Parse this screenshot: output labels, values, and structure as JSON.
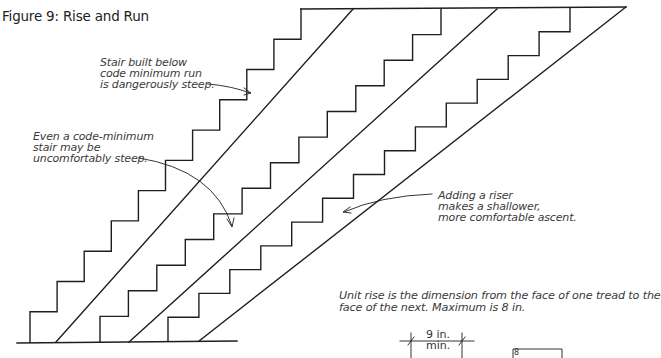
{
  "figure": {
    "title": "Figure 9: Rise and Run",
    "annotations": {
      "below_code": {
        "lines": [
          "Stair built below",
          "code minimum run",
          "is dangerously steep."
        ]
      },
      "code_minimum": {
        "lines": [
          "Even a code-minimum",
          "stair may be",
          "uncomfortably steep."
        ]
      },
      "adding_riser": {
        "lines": [
          "Adding a riser",
          "makes a shallower,",
          "more comfortable ascent."
        ]
      },
      "unit_rise": {
        "lines": [
          "Unit rise is the dimension from the face of one tread to the",
          "face of the next. Maximum is 8 in."
        ]
      }
    },
    "dimension": {
      "value": "9 in.",
      "qualifier": "min."
    },
    "detail_marker": "8",
    "stairs": [
      {
        "name": "below-code stair",
        "risers": 11,
        "start_x": 30,
        "top_x": 301,
        "ground_y": 342,
        "top_y": 9,
        "stringer_bottom_x": 56,
        "stringer_top_x": 353
      },
      {
        "name": "code-minimum stair",
        "risers": 13,
        "start_x": 100,
        "top_x": 441,
        "ground_y": 342,
        "top_y": 9,
        "stringer_bottom_x": 129,
        "stringer_top_x": 497
      },
      {
        "name": "added-riser stair",
        "risers": 14,
        "start_x": 168,
        "top_x": 570,
        "ground_y": 341,
        "top_y": 8,
        "stringer_bottom_x": 199,
        "stringer_top_x": 626
      }
    ],
    "colors": {
      "line": "#1e1e1e",
      "text": "#3a3a3a",
      "background": "#ffffff"
    }
  }
}
